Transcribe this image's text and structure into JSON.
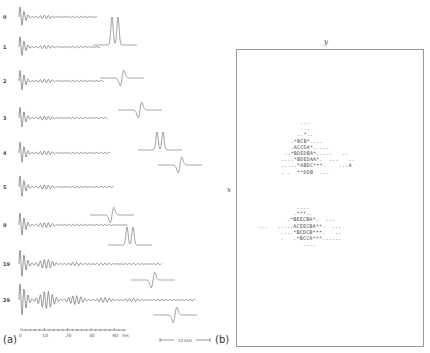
{
  "figure": {
    "panel_a": {
      "label": "(a)",
      "row_labels": [
        "0",
        "1",
        "2",
        "3",
        "4",
        "5",
        "9",
        "19",
        "29"
      ],
      "time_axis": {
        "ticks": [
          "0",
          "10",
          "20",
          "30",
          "40"
        ],
        "unit": "ms"
      },
      "scale_bar": "10 kHz"
    },
    "panel_b": {
      "label": "(b)",
      "x_axis_label": "x",
      "y_axis_label": "y",
      "upper_cluster": [
        "      ...",
        "      ...",
        "     ..*..",
        "   .*BCB*....",
        "   .ACCDA*.....",
        " ..*BDEDBA*.....   ..",
        "....*BDEDAA*.  ...   ..",
        ".....*ABDC***.    ...4",
        ". .  **DDB  ..."
      ],
      "lower_cluster": [
        "            ....",
        "           .***..",
        "         .*BEECBA*.  ...",
        "...   .....ACEECBA**.  ...",
        "       ....*BCDCB***.   ..",
        "       .   .*BCCA***......",
        "              ...."
      ]
    }
  }
}
